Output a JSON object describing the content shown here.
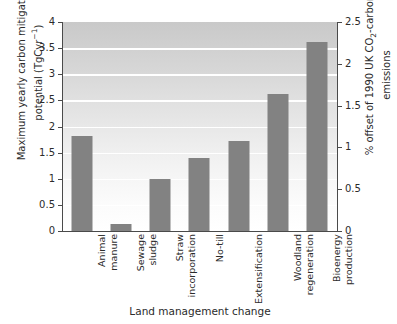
{
  "chart_data": {
    "type": "bar",
    "title": "",
    "categories": [
      "Animal manure",
      "Sewage sludge",
      "Straw incorporation",
      "No-till",
      "Extensification",
      "Woodland regeneration",
      "Bioenergy production"
    ],
    "category_lines": [
      "Animal\nmanure",
      "Sewage\nsludge",
      "Straw\nincorporation",
      "No-till",
      "Extensification",
      "Woodland\nregeneration",
      "Bioenergy\nproduction"
    ],
    "values": [
      1.82,
      0.13,
      1.0,
      1.4,
      1.72,
      2.62,
      3.62
    ],
    "xlabel": "Land management change",
    "ylabel": "Maximum yearly carbon mitigation potential (TgCyr-1)",
    "ylabel_line1": "Maximum yearly carbon mitigation",
    "ylabel_line2_prefix": "potential (TgCyr",
    "ylabel_line2_sup": "−1",
    "ylabel_line2_suffix": ")",
    "ylabel_right": "% offset of 1990 UK CO2-carbon emissions",
    "ylabel_right_prefix": "% offset of 1990 UK CO",
    "ylabel_right_sub": "2",
    "ylabel_right_mid": "-carbon",
    "ylabel_right_line2": "emissions",
    "ylim": [
      0,
      4
    ],
    "yticks": [
      "0",
      "0.5",
      "1",
      "1.5",
      "2",
      "2.5",
      "3",
      "3.5",
      "4"
    ],
    "ytick_values": [
      0,
      0.5,
      1,
      1.5,
      2,
      2.5,
      3,
      3.5,
      4
    ],
    "ylim_right": [
      0,
      2.5
    ],
    "yticks_right": [
      "0",
      "0.5",
      "1",
      "1.5",
      "2",
      "2.5"
    ],
    "ytick_values_right": [
      0,
      0.5,
      1,
      1.5,
      2,
      2.5
    ],
    "grid": true,
    "legend": "none",
    "bar_color": "#828282",
    "axis_color": "#4a4a4a",
    "plot_bg_top": "#c9c9c9",
    "plot_bg_bottom": "#ffffff"
  }
}
